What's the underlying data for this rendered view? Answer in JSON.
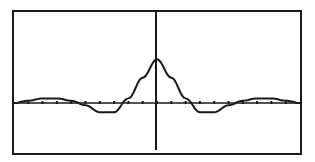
{
  "chart_data": {
    "type": "line",
    "title": "",
    "xlabel": "",
    "ylabel": "",
    "function_shape": "sinc-like (damped oscillation, central peak at x=0)",
    "grid": false,
    "legend": null,
    "xlim": [
      -10,
      10
    ],
    "ylim": [
      -0.5,
      1.0
    ],
    "x_tick_step": 1,
    "x": [
      -10,
      -9,
      -8,
      -7,
      -6,
      -5,
      -4,
      -3,
      -2,
      -1,
      0,
      1,
      2,
      3,
      4,
      5,
      6,
      7,
      8,
      9,
      10
    ],
    "values": [
      0.0,
      0.05,
      0.1,
      0.1,
      0.05,
      -0.05,
      -0.2,
      -0.2,
      0.1,
      0.55,
      0.95,
      0.55,
      0.1,
      -0.2,
      -0.2,
      -0.05,
      0.05,
      0.1,
      0.1,
      0.05,
      0.0
    ]
  },
  "colors": {
    "background": "#ffffff",
    "ink": "#1a1a1a"
  }
}
